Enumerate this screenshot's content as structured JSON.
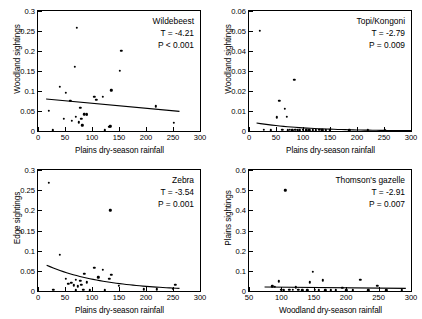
{
  "figure": {
    "panel_count": 4
  },
  "chart_data": [
    {
      "id": "wildebeest",
      "type": "scatter",
      "title": "Wildebeest",
      "annotation_t": "T = -4.21",
      "annotation_p": "P < 0.001",
      "xlabel": "Plains dry-season rainfall",
      "ylabel": "Woodland sightings",
      "xlim": [
        0,
        300
      ],
      "ylim": [
        0,
        0.3
      ],
      "xticks": [
        0,
        50,
        100,
        150,
        200,
        250,
        300
      ],
      "yticks": [
        0,
        0.05,
        0.1,
        0.15,
        0.2,
        0.25,
        0.3
      ],
      "ytick_labels": [
        "0",
        "0.05",
        "0.1",
        "0.15",
        "0.2",
        "0.25",
        "0.3"
      ],
      "grid": false,
      "legend": "none",
      "points": [
        [
          20,
          0.05
        ],
        [
          27,
          0.002
        ],
        [
          40,
          0.11
        ],
        [
          48,
          0.03
        ],
        [
          52,
          0.096
        ],
        [
          60,
          0.075
        ],
        [
          63,
          0.025
        ],
        [
          68,
          0.16
        ],
        [
          70,
          0.035
        ],
        [
          72,
          0.258
        ],
        [
          75,
          0.022
        ],
        [
          78,
          0.058
        ],
        [
          80,
          0.03
        ],
        [
          82,
          0.014
        ],
        [
          86,
          0.042
        ],
        [
          90,
          0.041
        ],
        [
          90,
          0.042
        ],
        [
          104,
          0.085
        ],
        [
          108,
          0.078
        ],
        [
          120,
          0.086
        ],
        [
          124,
          0.002
        ],
        [
          132,
          0.01
        ],
        [
          134,
          0.012
        ],
        [
          136,
          0.102
        ],
        [
          152,
          0.15
        ],
        [
          154,
          0.2
        ],
        [
          218,
          0.062
        ],
        [
          252,
          0.02
        ]
      ],
      "fit": {
        "kind": "linear",
        "x0": 15,
        "y0": 0.08,
        "x1": 262,
        "y1": 0.049
      }
    },
    {
      "id": "topi-kongoni",
      "type": "scatter",
      "title": "Topi/Kongoni",
      "annotation_t": "T = -2.79",
      "annotation_p": "P = 0.009",
      "xlabel": "Plains dry-season rainfall",
      "ylabel": "Woodland sightings",
      "xlim": [
        0,
        300
      ],
      "ylim": [
        0,
        0.06
      ],
      "xticks": [
        0,
        50,
        100,
        150,
        200,
        250,
        300
      ],
      "yticks": [
        0,
        0.01,
        0.02,
        0.03,
        0.04,
        0.05,
        0.06
      ],
      "ytick_labels": [
        "0",
        "0.01",
        "0.02",
        "0.03",
        "0.04",
        "0.05",
        "0.06"
      ],
      "grid": false,
      "legend": "none",
      "points": [
        [
          20,
          0.05
        ],
        [
          27,
          0.0005
        ],
        [
          40,
          0.0004
        ],
        [
          52,
          0.0068
        ],
        [
          56,
          0.015
        ],
        [
          62,
          0.0005
        ],
        [
          66,
          0.011
        ],
        [
          70,
          0.0072
        ],
        [
          72,
          0.0004
        ],
        [
          76,
          0.0006
        ],
        [
          80,
          0.0004
        ],
        [
          84,
          0.0256
        ],
        [
          86,
          0.0005
        ],
        [
          90,
          0.0004
        ],
        [
          94,
          0.0004
        ],
        [
          100,
          0.0005
        ],
        [
          106,
          0.0004
        ],
        [
          112,
          0.0004
        ],
        [
          118,
          0.0004
        ],
        [
          124,
          0.0004
        ],
        [
          130,
          0.0005
        ],
        [
          136,
          0.0004
        ],
        [
          142,
          0.0004
        ],
        [
          150,
          0.0004
        ],
        [
          186,
          0.0004
        ],
        [
          220,
          0.0004
        ],
        [
          252,
          0.0004
        ]
      ],
      "fit": {
        "kind": "exp",
        "x0": 14,
        "y0": 0.004,
        "x1": 300,
        "y1": 0.00018
      }
    },
    {
      "id": "zebra",
      "type": "scatter",
      "title": "Zebra",
      "annotation_t": "T = -3.54",
      "annotation_p": "P = 0.001",
      "xlabel": "Plains dry-season rainfall",
      "ylabel": "Edge sightings",
      "xlim": [
        0,
        300
      ],
      "ylim": [
        0,
        0.3
      ],
      "xticks": [
        0,
        50,
        100,
        150,
        200,
        250,
        300
      ],
      "yticks": [
        0,
        0.05,
        0.1,
        0.15,
        0.2,
        0.25,
        0.3
      ],
      "ytick_labels": [
        "0",
        "0.05",
        "0.1",
        "0.15",
        "0.2",
        "0.25",
        "0.3"
      ],
      "grid": false,
      "legend": "none",
      "points": [
        [
          20,
          0.268
        ],
        [
          28,
          0.003
        ],
        [
          40,
          0.09
        ],
        [
          52,
          0.03
        ],
        [
          56,
          0.018
        ],
        [
          62,
          0.02
        ],
        [
          66,
          0.014
        ],
        [
          70,
          0.028
        ],
        [
          70,
          0.002
        ],
        [
          74,
          0.012
        ],
        [
          78,
          0.026
        ],
        [
          80,
          0.016
        ],
        [
          84,
          0.003
        ],
        [
          86,
          0.042
        ],
        [
          90,
          0.022
        ],
        [
          96,
          0.002
        ],
        [
          104,
          0.058
        ],
        [
          112,
          0.034
        ],
        [
          120,
          0.052
        ],
        [
          124,
          0.002
        ],
        [
          132,
          0.03
        ],
        [
          134,
          0.2
        ],
        [
          136,
          0.04
        ],
        [
          150,
          0.013
        ],
        [
          196,
          0.004
        ],
        [
          220,
          0.004
        ],
        [
          250,
          0.006
        ],
        [
          254,
          0.016
        ]
      ],
      "fit": {
        "kind": "exp",
        "x0": 16,
        "y0": 0.064,
        "x1": 262,
        "y1": 0.0065
      }
    },
    {
      "id": "thomsons-gazelle",
      "type": "scatter",
      "title": "Thomson's gazelle",
      "annotation_t": "T = -2.91",
      "annotation_p": "P = 0.007",
      "xlabel": "Woodland dry-season rainfall",
      "ylabel": "Plains sightings",
      "xlim": [
        50,
        300
      ],
      "ylim": [
        0,
        0.6
      ],
      "xticks": [
        50,
        100,
        150,
        200,
        250,
        300
      ],
      "yticks": [
        0,
        0.1,
        0.2,
        0.3,
        0.4,
        0.5,
        0.6
      ],
      "ytick_labels": [
        "0",
        "0.1",
        "0.2",
        "0.3",
        "0.4",
        "0.5",
        "0.6"
      ],
      "grid": false,
      "legend": "none",
      "points": [
        [
          86,
          0.024
        ],
        [
          90,
          0.022
        ],
        [
          96,
          0.048
        ],
        [
          100,
          0.006
        ],
        [
          104,
          0.004
        ],
        [
          106,
          0.5
        ],
        [
          112,
          0.006
        ],
        [
          118,
          0.006
        ],
        [
          122,
          0.018
        ],
        [
          126,
          0.005
        ],
        [
          132,
          0.004
        ],
        [
          140,
          0.004
        ],
        [
          144,
          0.044
        ],
        [
          148,
          0.094
        ],
        [
          152,
          0.006
        ],
        [
          158,
          0.004
        ],
        [
          164,
          0.054
        ],
        [
          168,
          0.004
        ],
        [
          176,
          0.004
        ],
        [
          184,
          0.004
        ],
        [
          194,
          0.016
        ],
        [
          200,
          0.004
        ],
        [
          210,
          0.004
        ],
        [
          222,
          0.056
        ],
        [
          234,
          0.004
        ],
        [
          248,
          0.026
        ],
        [
          262,
          0.004
        ],
        [
          286,
          0.004
        ]
      ],
      "fit": {
        "kind": "linear",
        "x0": 74,
        "y0": 0.02,
        "x1": 292,
        "y1": 0.013
      }
    }
  ]
}
